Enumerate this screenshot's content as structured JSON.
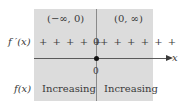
{
  "diagram": {
    "type": "sign-chart",
    "intervals": [
      {
        "label": "(−∞, 0)",
        "derivative_sign": "+ + + + +",
        "behavior": "Increasing"
      },
      {
        "label": "(0, ∞)",
        "derivative_sign": "+ + + + + +",
        "behavior": "Increasing"
      }
    ],
    "row_labels": {
      "derivative": "f ′(x)",
      "function": "f(x)"
    },
    "critical_point": {
      "value": "0",
      "derivative_value": "0"
    },
    "axis_label": "x",
    "colors": {
      "panel": "#dcdcdc",
      "divider": "#8a8a8a",
      "axis": "#5a5a5a",
      "dot": "#111111",
      "text": "#3a3a3a"
    }
  }
}
